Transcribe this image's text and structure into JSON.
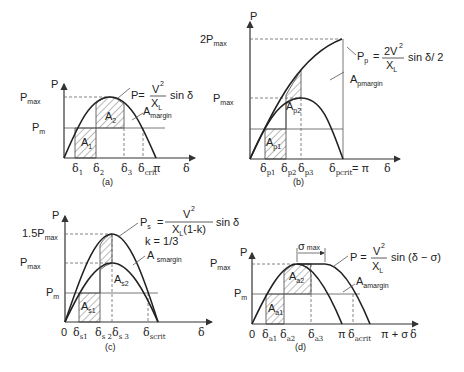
{
  "figure": {
    "panels": [
      {
        "id": "a",
        "caption": "(a)",
        "y_axis_label": "P",
        "x_axis_label": "δ",
        "y_ticks": [
          "Pmax",
          "Pm"
        ],
        "x_ticks": [
          "δ1",
          "δ2",
          "δ3",
          "δcrit",
          "π"
        ],
        "areas": [
          "A1",
          "A2",
          "Amargin"
        ],
        "equation": "P = V²/X_L sin δ"
      },
      {
        "id": "b",
        "caption": "(b)",
        "y_axis_label": "P",
        "x_axis_label": "δ",
        "y_ticks": [
          "2Pmax",
          "Pmax"
        ],
        "x_ticks": [
          "δp1",
          "δp2",
          "δp3",
          "δpcrit = π"
        ],
        "areas": [
          "Ap1",
          "Ap2",
          "Apmargin"
        ],
        "equation": "Pp = 2V²/X_L sin δ/2"
      },
      {
        "id": "c",
        "caption": "(c)",
        "y_axis_label": "P",
        "x_axis_label": "δ",
        "y_ticks": [
          "1.5Pmax",
          "Pmax",
          "Pm"
        ],
        "x_ticks": [
          "0",
          "δs1",
          "δs2",
          "δs3",
          "δscrit"
        ],
        "areas": [
          "As1",
          "As2",
          "A smargin"
        ],
        "equation": "Ps = V²/(X_L(1-k)) sin δ",
        "parameter": "k = 1/3"
      },
      {
        "id": "d",
        "caption": "(d)",
        "y_axis_label": "P",
        "x_axis_label": "δ",
        "y_ticks": [
          "Pmax",
          "Pm"
        ],
        "x_ticks": [
          "0",
          "δa1",
          "δa2",
          "δa3",
          "π",
          "δacrit",
          "π + σ"
        ],
        "areas": [
          "Aa1",
          "Aa2",
          "Aamargin"
        ],
        "equation": "P = V²/X_L sin (δ − σ)",
        "annotation": "σ max"
      }
    ]
  },
  "labels": {
    "P": "P",
    "delta": "δ",
    "pi": "π",
    "zero": "0",
    "max": "max",
    "m": "m",
    "crit": "crit",
    "margin": "margin",
    "a": {
      "Pmax_main": "P",
      "Pm_main": "P",
      "d1": "1",
      "d2": "2",
      "d3": "3",
      "A1": "A",
      "A1s": "1",
      "A2": "A",
      "A2s": "2",
      "Amargin": "A",
      "eqP": "P=",
      "eqNum": "V",
      "eqDen": "X",
      "eqDenSub": "L",
      "eqSin": "sin δ",
      "sq": "2",
      "caption": "(a)"
    },
    "b": {
      "twoPmax": "2P",
      "Pmax": "P",
      "dp1": "p1",
      "dp2": "p2",
      "dp3": "p3",
      "dpcrit": "pcrit",
      "eqpi": "= π",
      "Ap1": "p1",
      "Ap2": "p2",
      "Apmargin": "pmargin",
      "eqP": "P",
      "eqPs": "p",
      "eqEq": "=",
      "eqNum": "2V",
      "eqDen": "X",
      "eqDenSub": "L",
      "eqSin": "sin δ/ 2",
      "sq": "2",
      "caption": "(b)"
    },
    "c": {
      "onefive": "1.5P",
      "Pmax": "P",
      "Pm": "P",
      "ds1": "s1",
      "ds2": "s 2",
      "ds3": "s 3",
      "dscrit": "scrit",
      "As1": "s1",
      "As2": "s2",
      "Asmargin": "smargin",
      "eqP": "P",
      "eqPs": "s",
      "eqEq": "=",
      "eqNum": "V",
      "eqDen": "X",
      "eqDenSub": "L",
      "eqDenRest": "(1-k)",
      "eqSin": "sin δ",
      "sq": "2",
      "k": "k = 1/3",
      "caption": "(c)"
    },
    "d": {
      "Pmax": "P",
      "Pm": "P",
      "da1": "a1",
      "da2": "a2",
      "da3": "a3",
      "dacrit": "acrit",
      "pisigma": "π + σ",
      "Aa1": "a1",
      "Aa2": "a2",
      "Aamargin": "amargin",
      "sigma": "σ",
      "sigmaMax": "max",
      "eqP": "P =",
      "eqNum": "V",
      "eqDen": "X",
      "eqDenSub": "L",
      "eqSin": "sin (δ − σ)",
      "sq": "2",
      "caption": "(d)"
    }
  }
}
